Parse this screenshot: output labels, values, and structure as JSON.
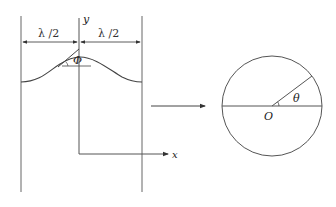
{
  "left_figure": {
    "axis_labels": {
      "y": "y",
      "x": "x"
    },
    "dimensions": [
      {
        "label": "λ /2",
        "position": "left"
      },
      {
        "label": "λ /2",
        "position": "right"
      }
    ],
    "angle_label": "Φ",
    "description": "Wave crest between two vertical boundaries, half-wavelength each side, tangent angle Φ"
  },
  "connector": {
    "type": "arrow",
    "direction": "right"
  },
  "right_figure": {
    "center_label": "O",
    "angle_label": "θ",
    "description": "Circle with horizontal diameter and radius at angle θ"
  },
  "colors": {
    "stroke": "#555555",
    "text": "#222222",
    "background": "#ffffff"
  }
}
